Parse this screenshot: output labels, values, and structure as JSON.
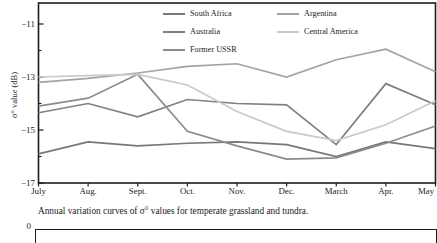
{
  "chart_data": {
    "type": "line",
    "title": "",
    "xlabel": "",
    "ylabel": "σ° value (dB)",
    "categories": [
      "July",
      "Aug.",
      "Sept.",
      "Oct.",
      "Nov.",
      "Dec.",
      "March",
      "Apr.",
      "May"
    ],
    "series": [
      {
        "name": "South Africa",
        "color": "#777777",
        "values": [
          -15.9,
          -15.45,
          -15.6,
          -15.5,
          -15.45,
          -15.55,
          -16.0,
          -15.45,
          -15.7
        ]
      },
      {
        "name": "Australia",
        "color": "#808080",
        "values": [
          -14.35,
          -14.0,
          -14.5,
          -13.85,
          -14.0,
          -14.05,
          -15.55,
          -13.25,
          -14.05
        ]
      },
      {
        "name": "Former USSR",
        "color": "#8c8c8c",
        "values": [
          -14.1,
          -13.8,
          -12.9,
          -15.05,
          -15.6,
          -16.1,
          -16.05,
          -15.5,
          -14.85
        ]
      },
      {
        "name": "Argentina",
        "color": "#a3a3a3",
        "values": [
          -13.2,
          -13.05,
          -12.85,
          -12.6,
          -12.5,
          -13.0,
          -12.35,
          -11.95,
          -12.8
        ]
      },
      {
        "name": "Central America",
        "color": "#c9c9c9",
        "values": [
          -13.0,
          -12.95,
          -12.9,
          -13.3,
          -14.3,
          -15.05,
          -15.4,
          -14.8,
          -13.9
        ]
      }
    ],
    "ylim": [
      -17,
      -10.2
    ],
    "y_ticks": [
      {
        "v": -11,
        "label": "−11"
      },
      {
        "v": -13,
        "label": "−13"
      },
      {
        "v": -15,
        "label": "−15"
      },
      {
        "v": -17,
        "label": "−17"
      }
    ],
    "y_minor_ticks": [
      -12,
      -14,
      -16
    ],
    "grid": false,
    "legend_position": "top-center-two-columns"
  },
  "caption": "Annual variation curves of σ° values for temperate grassland and tundra.",
  "next_chart_fragment": {
    "y_tick_label": "0"
  }
}
